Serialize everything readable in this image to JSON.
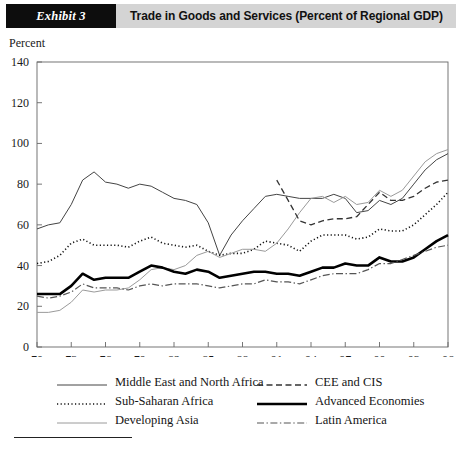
{
  "header": {
    "exhibit_tag": "Exhibit 3",
    "title": "Trade in Goods and Services (Percent of Regional GDP)"
  },
  "axis_title": "Percent",
  "legend": {
    "items": [
      {
        "label": "Middle East and North Africa",
        "key": "solid-thin",
        "column": 0
      },
      {
        "label": "CEE and CIS",
        "key": "dashed",
        "column": 1
      },
      {
        "label": "Sub-Saharan Africa",
        "key": "dotted",
        "column": 0
      },
      {
        "label": "Advanced Economies",
        "key": "solid-thick",
        "column": 1
      },
      {
        "label": "Developing Asia",
        "key": "solid-gray",
        "column": 0
      },
      {
        "label": "Latin America",
        "key": "dash-dot",
        "column": 1
      }
    ]
  },
  "chart_data": {
    "type": "line",
    "title": "Trade in Goods and Services (Percent of Regional GDP)",
    "xlabel": "",
    "ylabel": "Percent",
    "ylim": [
      0,
      140
    ],
    "xlim": [
      1970,
      2006
    ],
    "ytick_step": 20,
    "yticks": [
      0,
      20,
      40,
      60,
      80,
      100,
      120,
      140
    ],
    "xticks": [
      1970,
      1973,
      1976,
      1979,
      1982,
      1985,
      1988,
      1991,
      1994,
      1997,
      2000,
      2003,
      2006
    ],
    "xtick_labels": [
      "70",
      "73",
      "76",
      "79",
      "82",
      "85",
      "88",
      "91",
      "94",
      "97",
      "00",
      "03",
      "06"
    ],
    "grid": false,
    "legend_position": "below",
    "x": [
      1970,
      1971,
      1972,
      1973,
      1974,
      1975,
      1976,
      1977,
      1978,
      1979,
      1980,
      1981,
      1982,
      1983,
      1984,
      1985,
      1986,
      1987,
      1988,
      1989,
      1990,
      1991,
      1992,
      1993,
      1994,
      1995,
      1996,
      1997,
      1998,
      1999,
      2000,
      2001,
      2002,
      2003,
      2004,
      2005,
      2006
    ],
    "series": [
      {
        "name": "Middle East and North Africa",
        "style": "solid-thin",
        "color": "#444444",
        "x": [
          1970,
          1971,
          1972,
          1973,
          1974,
          1975,
          1976,
          1977,
          1978,
          1979,
          1980,
          1981,
          1982,
          1983,
          1984,
          1985,
          1986,
          1987,
          1988,
          1989,
          1990,
          1991,
          1992,
          1993,
          1994,
          1995,
          1996,
          1997,
          1998,
          1999,
          2000,
          2001,
          2002,
          2003,
          2004,
          2005,
          2006
        ],
        "values": [
          58,
          60,
          61,
          70,
          82,
          86,
          81,
          80,
          78,
          80,
          79,
          76,
          73,
          72,
          70,
          61,
          45,
          55,
          62,
          68,
          74,
          75,
          74,
          73,
          73,
          73,
          75,
          73,
          66,
          67,
          72,
          70,
          73,
          80,
          87,
          92,
          95
        ]
      },
      {
        "name": "Sub-Saharan Africa",
        "style": "dotted",
        "color": "#111111",
        "x": [
          1970,
          1971,
          1972,
          1973,
          1974,
          1975,
          1976,
          1977,
          1978,
          1979,
          1980,
          1981,
          1982,
          1983,
          1984,
          1985,
          1986,
          1987,
          1988,
          1989,
          1990,
          1991,
          1992,
          1993,
          1994,
          1995,
          1996,
          1997,
          1998,
          1999,
          2000,
          2001,
          2002,
          2003,
          2004,
          2005,
          2006
        ],
        "values": [
          41,
          42,
          45,
          51,
          53,
          50,
          50,
          50,
          49,
          52,
          54,
          51,
          50,
          49,
          50,
          47,
          45,
          46,
          46,
          48,
          52,
          51,
          50,
          47,
          52,
          55,
          55,
          55,
          53,
          54,
          58,
          57,
          57,
          60,
          65,
          70,
          76
        ]
      },
      {
        "name": "Developing Asia",
        "style": "solid-gray",
        "color": "#9a9a9a",
        "x": [
          1970,
          1971,
          1972,
          1973,
          1974,
          1975,
          1976,
          1977,
          1978,
          1979,
          1980,
          1981,
          1982,
          1983,
          1984,
          1985,
          1986,
          1987,
          1988,
          1989,
          1990,
          1991,
          1992,
          1993,
          1994,
          1995,
          1996,
          1997,
          1998,
          1999,
          2000,
          2001,
          2002,
          2003,
          2004,
          2005,
          2006
        ],
        "values": [
          17,
          17,
          18,
          22,
          28,
          27,
          28,
          28,
          29,
          33,
          38,
          39,
          38,
          40,
          45,
          47,
          44,
          46,
          48,
          48,
          47,
          51,
          58,
          66,
          73,
          74,
          71,
          74,
          70,
          71,
          77,
          74,
          77,
          84,
          91,
          95,
          97
        ]
      },
      {
        "name": "CEE and CIS",
        "style": "dashed",
        "color": "#333333",
        "x": [
          1991,
          1992,
          1993,
          1994,
          1995,
          1996,
          1997,
          1998,
          1999,
          2000,
          2001,
          2002,
          2003,
          2004,
          2005,
          2006
        ],
        "values": [
          82,
          72,
          62,
          60,
          62,
          63,
          63,
          64,
          70,
          76,
          72,
          72,
          74,
          78,
          81,
          82
        ]
      },
      {
        "name": "Advanced Economies",
        "style": "solid-thick",
        "color": "#000000",
        "x": [
          1970,
          1971,
          1972,
          1973,
          1974,
          1975,
          1976,
          1977,
          1978,
          1979,
          1980,
          1981,
          1982,
          1983,
          1984,
          1985,
          1986,
          1987,
          1988,
          1989,
          1990,
          1991,
          1992,
          1993,
          1994,
          1995,
          1996,
          1997,
          1998,
          1999,
          2000,
          2001,
          2002,
          2003,
          2004,
          2005,
          2006
        ],
        "values": [
          26,
          26,
          26,
          30,
          36,
          33,
          34,
          34,
          34,
          37,
          40,
          39,
          37,
          36,
          38,
          37,
          34,
          35,
          36,
          37,
          37,
          36,
          36,
          35,
          37,
          39,
          39,
          41,
          40,
          40,
          44,
          42,
          42,
          44,
          48,
          52,
          55
        ]
      },
      {
        "name": "Latin America",
        "style": "dash-dot",
        "color": "#555555",
        "x": [
          1970,
          1971,
          1972,
          1973,
          1974,
          1975,
          1976,
          1977,
          1978,
          1979,
          1980,
          1981,
          1982,
          1983,
          1984,
          1985,
          1986,
          1987,
          1988,
          1989,
          1990,
          1991,
          1992,
          1993,
          1994,
          1995,
          1996,
          1997,
          1998,
          1999,
          2000,
          2001,
          2002,
          2003,
          2004,
          2005,
          2006
        ],
        "values": [
          25,
          24,
          25,
          27,
          31,
          29,
          29,
          29,
          28,
          30,
          31,
          30,
          31,
          31,
          31,
          30,
          29,
          30,
          31,
          31,
          33,
          32,
          32,
          31,
          33,
          35,
          36,
          36,
          36,
          38,
          41,
          41,
          43,
          45,
          47,
          49,
          50
        ]
      }
    ]
  }
}
